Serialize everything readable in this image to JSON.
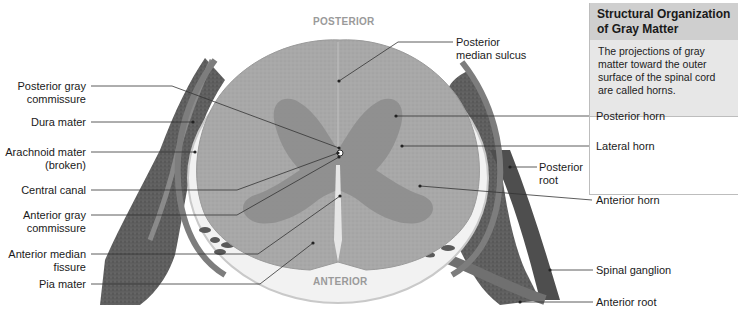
{
  "figure": {
    "orientation": {
      "top": "POSTERIOR",
      "bottom": "ANTERIOR"
    },
    "left_labels": [
      {
        "id": "posterior-gray-commissure",
        "lines": [
          "Posterior gray",
          "commissure"
        ]
      },
      {
        "id": "dura-mater",
        "lines": [
          "Dura mater"
        ]
      },
      {
        "id": "arachnoid-mater",
        "lines": [
          "Arachnoid mater",
          "(broken)"
        ]
      },
      {
        "id": "central-canal",
        "lines": [
          "Central canal"
        ]
      },
      {
        "id": "anterior-gray-commissure",
        "lines": [
          "Anterior gray",
          "commissure"
        ]
      },
      {
        "id": "anterior-median-fissure",
        "lines": [
          "Anterior median",
          "fissure"
        ]
      },
      {
        "id": "pia-mater",
        "lines": [
          "Pia mater"
        ]
      }
    ],
    "top_label": {
      "id": "posterior-median-sulcus",
      "lines": [
        "Posterior",
        "median sulcus"
      ]
    },
    "right_labels": [
      {
        "id": "posterior-root",
        "lines": [
          "Posterior",
          "root"
        ]
      },
      {
        "id": "spinal-ganglion",
        "lines": [
          "Spinal ganglion"
        ]
      },
      {
        "id": "anterior-root",
        "lines": [
          "Anterior root"
        ]
      }
    ],
    "infobox": {
      "title_lines": [
        "Structural Organization",
        "of Gray Matter"
      ],
      "description_lines": [
        "The projections of gray",
        "matter toward the outer",
        "surface of the spinal cord",
        "are called horns."
      ],
      "items": [
        "Posterior horn",
        "Lateral horn",
        "Anterior horn"
      ]
    },
    "colors": {
      "white_matter": "#a9a9a9",
      "gray_matter": "#8a8a8a",
      "meninges": "#7a7a7a",
      "ganglion": "#5e5e5e",
      "box_header": "#cfcfcf",
      "box_desc": "#e7e7e7",
      "orientation_text": "#9a9a9a"
    }
  }
}
